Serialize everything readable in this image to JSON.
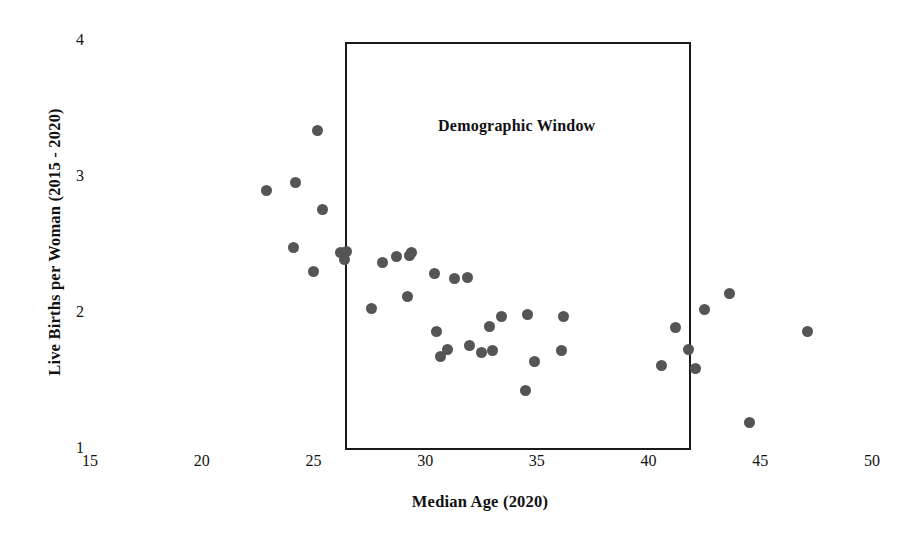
{
  "chart_data": {
    "type": "scatter",
    "title": "",
    "xlabel": "Median Age (2020)",
    "ylabel": "Live Births per Woman (2015 - 2020)",
    "xlim": [
      15,
      50
    ],
    "ylim": [
      1,
      4
    ],
    "xticks": [
      15,
      20,
      25,
      30,
      35,
      40,
      45,
      50
    ],
    "yticks": [
      1,
      2,
      3,
      4
    ],
    "grid": false,
    "legend": null,
    "marker_color": "#555555",
    "annotations": [
      {
        "label": "Demographic Window",
        "type": "rect",
        "x0": 26.4,
        "x1": 41.9,
        "y0": 1.0,
        "y1": 4.0,
        "label_x": 34.1,
        "label_y": 3.38
      }
    ],
    "points": [
      {
        "x": 22.9,
        "y": 2.91
      },
      {
        "x": 24.2,
        "y": 2.97
      },
      {
        "x": 25.2,
        "y": 3.35
      },
      {
        "x": 25.4,
        "y": 2.77
      },
      {
        "x": 24.1,
        "y": 2.49
      },
      {
        "x": 25.0,
        "y": 2.31
      },
      {
        "x": 26.2,
        "y": 2.45
      },
      {
        "x": 26.5,
        "y": 2.46
      },
      {
        "x": 26.4,
        "y": 2.4
      },
      {
        "x": 27.6,
        "y": 2.04
      },
      {
        "x": 28.1,
        "y": 2.38
      },
      {
        "x": 28.7,
        "y": 2.42
      },
      {
        "x": 29.3,
        "y": 2.43
      },
      {
        "x": 29.4,
        "y": 2.45
      },
      {
        "x": 29.2,
        "y": 2.13
      },
      {
        "x": 30.4,
        "y": 2.3
      },
      {
        "x": 31.3,
        "y": 2.26
      },
      {
        "x": 31.9,
        "y": 2.27
      },
      {
        "x": 30.5,
        "y": 1.87
      },
      {
        "x": 31.0,
        "y": 1.74
      },
      {
        "x": 30.7,
        "y": 1.69
      },
      {
        "x": 32.0,
        "y": 1.77
      },
      {
        "x": 32.5,
        "y": 1.72
      },
      {
        "x": 32.9,
        "y": 1.91
      },
      {
        "x": 33.4,
        "y": 1.98
      },
      {
        "x": 33.0,
        "y": 1.73
      },
      {
        "x": 34.5,
        "y": 1.44
      },
      {
        "x": 34.9,
        "y": 1.65
      },
      {
        "x": 34.6,
        "y": 2.0
      },
      {
        "x": 36.2,
        "y": 1.98
      },
      {
        "x": 36.1,
        "y": 1.73
      },
      {
        "x": 40.6,
        "y": 1.62
      },
      {
        "x": 41.2,
        "y": 1.9
      },
      {
        "x": 41.8,
        "y": 1.74
      },
      {
        "x": 42.1,
        "y": 1.6
      },
      {
        "x": 42.5,
        "y": 2.03
      },
      {
        "x": 43.6,
        "y": 2.15
      },
      {
        "x": 44.5,
        "y": 1.2
      },
      {
        "x": 47.1,
        "y": 1.87
      }
    ]
  },
  "geometry": {
    "x_pixel_at_min": 90,
    "x_pixel_at_max": 872,
    "y_pixel_at_min": 450,
    "y_pixel_at_max": 42
  }
}
